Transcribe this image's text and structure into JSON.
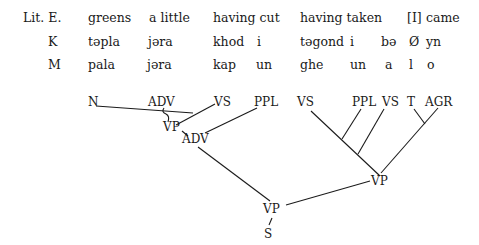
{
  "glosses": {
    "lit_english": {
      "label": "Lit. E.",
      "words": [
        "greens",
        "a little",
        "having cut",
        "having taken",
        "[I]",
        "came"
      ]
    },
    "k": {
      "label": "K",
      "words": [
        "təpla",
        "jəra",
        "khod",
        "i",
        "təgond",
        "i",
        "bə",
        "Ø",
        "yn"
      ]
    },
    "m": {
      "label": "M",
      "words": [
        "pala",
        "jəra",
        "kap",
        "un",
        "ghe",
        "un",
        "a",
        "l",
        "o"
      ]
    }
  },
  "tree": {
    "leaves": [
      "N",
      "ADV",
      "VS",
      "PPL",
      "VS",
      "PPL",
      "VS",
      "T",
      "AGR"
    ],
    "internal": [
      "VP",
      "ADV",
      "VP",
      "VP",
      "S"
    ]
  }
}
